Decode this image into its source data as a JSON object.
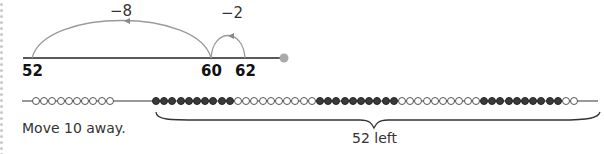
{
  "number_line": {
    "labels": [
      {
        "text": "52",
        "x": 22,
        "y": 62
      },
      {
        "text": "60",
        "x": 201,
        "y": 62
      },
      {
        "text": "62",
        "x": 235,
        "y": 62
      }
    ],
    "jumps": [
      {
        "text": "−8",
        "x": 110,
        "y": 2
      },
      {
        "text": "−2",
        "x": 221,
        "y": 4
      }
    ],
    "end_marker_color": "#aaaaaa",
    "arc_color": "#999999"
  },
  "bead_string": {
    "left_group": {
      "count": 10,
      "color": "white"
    },
    "right_group": [
      {
        "count": 10,
        "color": "black"
      },
      {
        "count": 10,
        "color": "white"
      },
      {
        "count": 10,
        "color": "black"
      },
      {
        "count": 10,
        "color": "white"
      },
      {
        "count": 10,
        "color": "black"
      },
      {
        "count": 2,
        "color": "white"
      }
    ]
  },
  "captions": {
    "instruction": "Move 10 away.",
    "brace_label": "52 left"
  }
}
